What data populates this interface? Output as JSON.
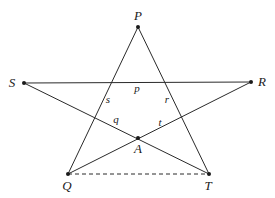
{
  "diagram": {
    "points": [
      {
        "id": "P",
        "label": "P",
        "x": 138,
        "y": 27,
        "lx": 138,
        "ly": 20
      },
      {
        "id": "S",
        "label": "S",
        "x": 24,
        "y": 83,
        "lx": 12,
        "ly": 87
      },
      {
        "id": "R",
        "label": "R",
        "x": 251,
        "y": 82,
        "lx": 262,
        "ly": 86
      },
      {
        "id": "Q",
        "label": "Q",
        "x": 68,
        "y": 174,
        "lx": 67,
        "ly": 190
      },
      {
        "id": "T",
        "label": "T",
        "x": 209,
        "y": 174,
        "lx": 208,
        "ly": 190
      },
      {
        "id": "A",
        "label": "A",
        "x": 138,
        "y": 138,
        "lx": 138,
        "ly": 153
      }
    ],
    "angle_labels": [
      {
        "id": "p",
        "label": "p",
        "x": 137,
        "y": 92
      },
      {
        "id": "s",
        "label": "s",
        "x": 108,
        "y": 103
      },
      {
        "id": "r",
        "label": "r",
        "x": 167,
        "y": 103
      },
      {
        "id": "q",
        "label": "q",
        "x": 116,
        "y": 123
      },
      {
        "id": "t",
        "label": "t",
        "x": 160,
        "y": 126
      }
    ],
    "segments": [
      {
        "from": "S",
        "to": "R",
        "style": "solid"
      },
      {
        "from": "P",
        "to": "Q",
        "style": "solid"
      },
      {
        "from": "P",
        "to": "T",
        "style": "solid"
      },
      {
        "from": "S",
        "to": "T",
        "style": "solid"
      },
      {
        "from": "Q",
        "to": "R",
        "style": "solid"
      },
      {
        "from": "Q",
        "to": "T",
        "style": "dashed"
      }
    ]
  }
}
